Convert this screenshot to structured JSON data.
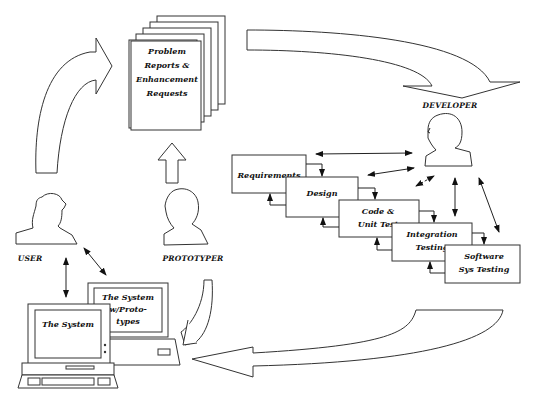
{
  "diagram": {
    "type": "software-maintenance-lifecycle",
    "documents": {
      "lines": [
        "Problem",
        "Reports &",
        "Enhancement",
        "Requests"
      ]
    },
    "actors": {
      "user": "USER",
      "prototyper": "PROTOTYPER",
      "developer": "DEVELOPER"
    },
    "phases": [
      {
        "lines": [
          "Requirements"
        ]
      },
      {
        "lines": [
          "Design"
        ]
      },
      {
        "lines": [
          "Code &",
          "Unit Test"
        ]
      },
      {
        "lines": [
          "Integration",
          "Testing"
        ]
      },
      {
        "lines": [
          "Software",
          "Sys Testing"
        ]
      }
    ],
    "computers": {
      "front": "The System",
      "back": [
        "The System",
        "w/Proto-",
        "types"
      ]
    },
    "colors": {
      "line": "#222222",
      "background": "#ffffff"
    }
  }
}
